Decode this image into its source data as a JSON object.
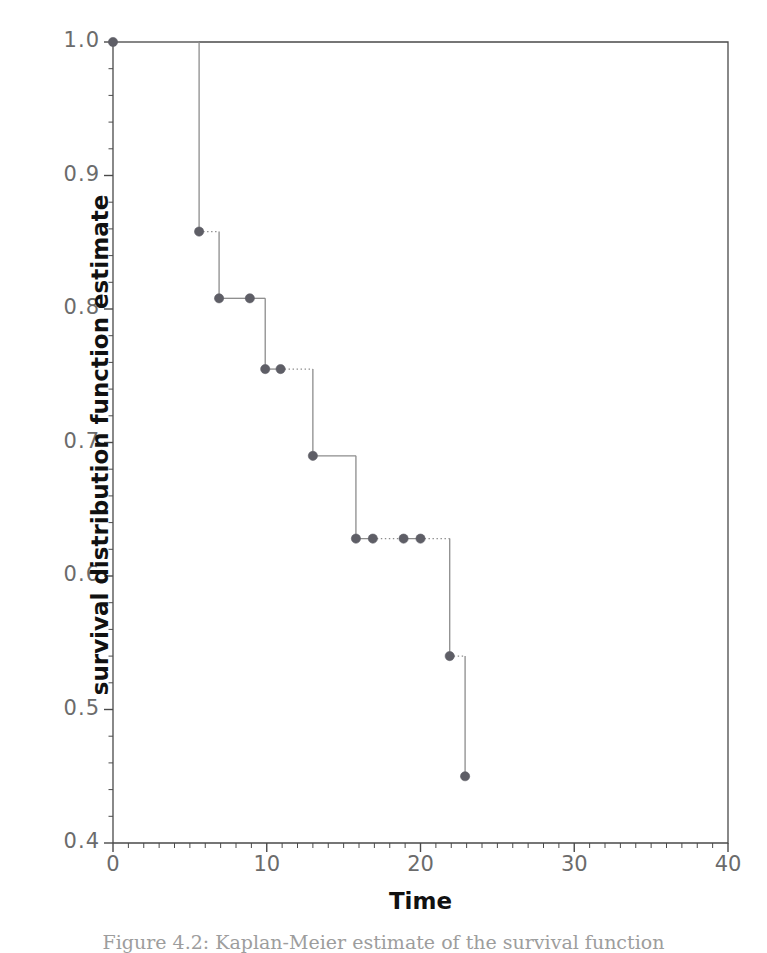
{
  "figure": {
    "caption": "Figure 4.2: Kaplan-Meier estimate of the survival function"
  },
  "chart_data": {
    "type": "line",
    "subtype": "kaplan-meier-step",
    "title": "",
    "xlabel": "Time",
    "ylabel": "survival distribution function estimate",
    "xlim": [
      0,
      40
    ],
    "ylim": [
      0.4,
      1.0
    ],
    "grid": false,
    "legend": null,
    "xticks": [
      0,
      10,
      20,
      30,
      40
    ],
    "xtick_labels": [
      "0",
      "10",
      "20",
      "30",
      "40"
    ],
    "xminor_tick_interval": 1,
    "yticks": [
      0.4,
      0.5,
      0.6,
      0.7,
      0.8,
      0.9,
      1.0
    ],
    "ytick_labels": [
      "0.4",
      "0.5",
      "0.6",
      "0.7",
      "0.8",
      "0.9",
      "1.0"
    ],
    "yminor_tick_interval": 0.02,
    "x": [
      0,
      5.6,
      6.9,
      8.9,
      9.9,
      10.9,
      13.0,
      15.8,
      16.9,
      18.9,
      20.0,
      21.9,
      22.9
    ],
    "y": [
      1.0,
      0.858,
      0.808,
      0.808,
      0.755,
      0.755,
      0.69,
      0.628,
      0.628,
      0.628,
      0.628,
      0.54,
      0.45
    ],
    "points": [
      {
        "x": 0.0,
        "y": 1.0,
        "censored": false
      },
      {
        "x": 5.6,
        "y": 0.858,
        "censored": false
      },
      {
        "x": 6.9,
        "y": 0.808,
        "censored": false
      },
      {
        "x": 8.9,
        "y": 0.808,
        "censored": true
      },
      {
        "x": 9.9,
        "y": 0.755,
        "censored": false
      },
      {
        "x": 10.9,
        "y": 0.755,
        "censored": true
      },
      {
        "x": 13.0,
        "y": 0.69,
        "censored": false
      },
      {
        "x": 15.8,
        "y": 0.628,
        "censored": false
      },
      {
        "x": 16.9,
        "y": 0.628,
        "censored": true
      },
      {
        "x": 18.9,
        "y": 0.628,
        "censored": true
      },
      {
        "x": 20.0,
        "y": 0.628,
        "censored": true
      },
      {
        "x": 21.9,
        "y": 0.54,
        "censored": false
      },
      {
        "x": 22.9,
        "y": 0.45,
        "censored": false
      }
    ],
    "segments": [
      {
        "from_x": 0.0,
        "to_x": 5.6,
        "y": 1.0,
        "style": "solid"
      },
      {
        "from_x": 5.6,
        "to_x": 6.9,
        "y": 0.858,
        "style": "dotted"
      },
      {
        "from_x": 6.9,
        "to_x": 8.9,
        "y": 0.808,
        "style": "solid"
      },
      {
        "from_x": 8.9,
        "to_x": 9.9,
        "y": 0.808,
        "style": "solid"
      },
      {
        "from_x": 9.9,
        "to_x": 10.9,
        "y": 0.755,
        "style": "solid"
      },
      {
        "from_x": 10.9,
        "to_x": 13.0,
        "y": 0.755,
        "style": "dotted"
      },
      {
        "from_x": 13.0,
        "to_x": 15.8,
        "y": 0.69,
        "style": "solid"
      },
      {
        "from_x": 15.8,
        "to_x": 16.9,
        "y": 0.628,
        "style": "solid"
      },
      {
        "from_x": 16.9,
        "to_x": 18.9,
        "y": 0.628,
        "style": "dotted"
      },
      {
        "from_x": 18.9,
        "to_x": 20.0,
        "y": 0.628,
        "style": "solid"
      },
      {
        "from_x": 20.0,
        "to_x": 21.9,
        "y": 0.628,
        "style": "dotted"
      },
      {
        "from_x": 21.9,
        "to_x": 22.9,
        "y": 0.54,
        "style": "dotted"
      }
    ],
    "colors": {
      "line": "#8c8c8c",
      "marker": "#5e5e66",
      "axis": "#4a4a4a",
      "tick_label": "#6b6b6b",
      "axis_title": "#111111"
    }
  }
}
